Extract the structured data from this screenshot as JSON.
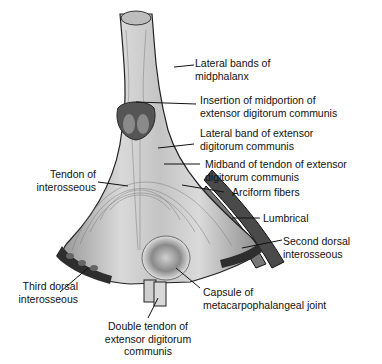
{
  "figure": {
    "colors": {
      "tissue_light": "#d8d8d8",
      "tissue_mid": "#a8a8a8",
      "tissue_dark": "#3a3a3a",
      "leader": "#111111",
      "text": "#111111"
    },
    "labels": [
      {
        "id": "lateral-bands-midphalanx",
        "lines": [
          "Lateral bands of",
          "midphalanx"
        ]
      },
      {
        "id": "insertion-midportion",
        "lines": [
          "Insertion of midportion of",
          "extensor digitorum communis"
        ]
      },
      {
        "id": "lateral-band-edc",
        "lines": [
          "Lateral band of extensor",
          "digitorum communis"
        ]
      },
      {
        "id": "midband-tendon",
        "lines": [
          "Midband of tendon of extensor",
          "digitorum communis"
        ]
      },
      {
        "id": "arciform-fibers",
        "lines": [
          "Arciform fibers"
        ]
      },
      {
        "id": "tendon-interosseous",
        "lines": [
          "Tendon of",
          "interosseous"
        ]
      },
      {
        "id": "lumbrical",
        "lines": [
          "Lumbrical"
        ]
      },
      {
        "id": "second-dorsal-interosseous",
        "lines": [
          "Second dorsal",
          "interosseous"
        ]
      },
      {
        "id": "third-dorsal-interosseous",
        "lines": [
          "Third dorsal",
          "interosseous"
        ]
      },
      {
        "id": "capsule-mcp-joint",
        "lines": [
          "Capsule of",
          "metacarpophalangeal joint"
        ]
      },
      {
        "id": "double-tendon-edc",
        "lines": [
          "Double tendon of",
          "extensor digitorum",
          "communis"
        ]
      }
    ]
  }
}
